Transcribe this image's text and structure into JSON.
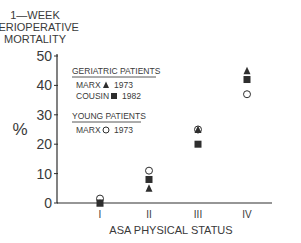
{
  "chart_data": {
    "type": "scatter",
    "title_lines": [
      "1—WEEK",
      "PERIOPERATIVE",
      "MORTALITY"
    ],
    "xlabel": "ASA PHYSICAL STATUS",
    "ylabel": "%",
    "categories": [
      "I",
      "II",
      "III",
      "IV"
    ],
    "ylim": [
      0,
      50
    ],
    "yticks": [
      0,
      10,
      20,
      30,
      40,
      50
    ],
    "grid": false,
    "legend_position": "upper-left-inside",
    "legend": {
      "groups": [
        {
          "heading": "GERIATRIC PATIENTS",
          "entries": [
            {
              "author": "MARX",
              "marker": "triangle-filled",
              "year": "1973"
            },
            {
              "author": "COUSIN",
              "marker": "square-filled",
              "year": "1982"
            }
          ]
        },
        {
          "heading": "YOUNG PATIENTS",
          "entries": [
            {
              "author": "MARX",
              "marker": "circle-open",
              "year": "1973"
            }
          ]
        }
      ]
    },
    "series": [
      {
        "name": "Geriatric - Marx 1973",
        "marker": "triangle-filled",
        "values": [
          0,
          5,
          25,
          45
        ]
      },
      {
        "name": "Geriatric - Cousin 1982",
        "marker": "square-filled",
        "values": [
          0,
          8,
          20,
          42
        ]
      },
      {
        "name": "Young - Marx 1973",
        "marker": "circle-open",
        "values": [
          1.5,
          11,
          25,
          37
        ]
      }
    ]
  }
}
